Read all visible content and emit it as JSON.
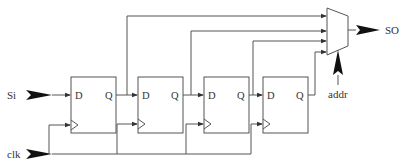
{
  "diagram": {
    "inputs": [
      {
        "id": "si",
        "label": "Si"
      },
      {
        "id": "clk",
        "label": "clk"
      },
      {
        "id": "addr",
        "label": "addr"
      }
    ],
    "outputs": [
      {
        "id": "so",
        "label": "SO"
      }
    ],
    "flip_flops": [
      {
        "id": "ff1",
        "d_label": "D",
        "q_label": "Q"
      },
      {
        "id": "ff2",
        "d_label": "D",
        "q_label": "Q"
      },
      {
        "id": "ff3",
        "d_label": "D",
        "q_label": "Q"
      },
      {
        "id": "ff4",
        "d_label": "D",
        "q_label": "Q"
      }
    ],
    "mux": {
      "id": "mux",
      "inputs": 4
    },
    "colors": {
      "line": "#555555",
      "arrow": "#111111",
      "text": "#333333"
    }
  }
}
